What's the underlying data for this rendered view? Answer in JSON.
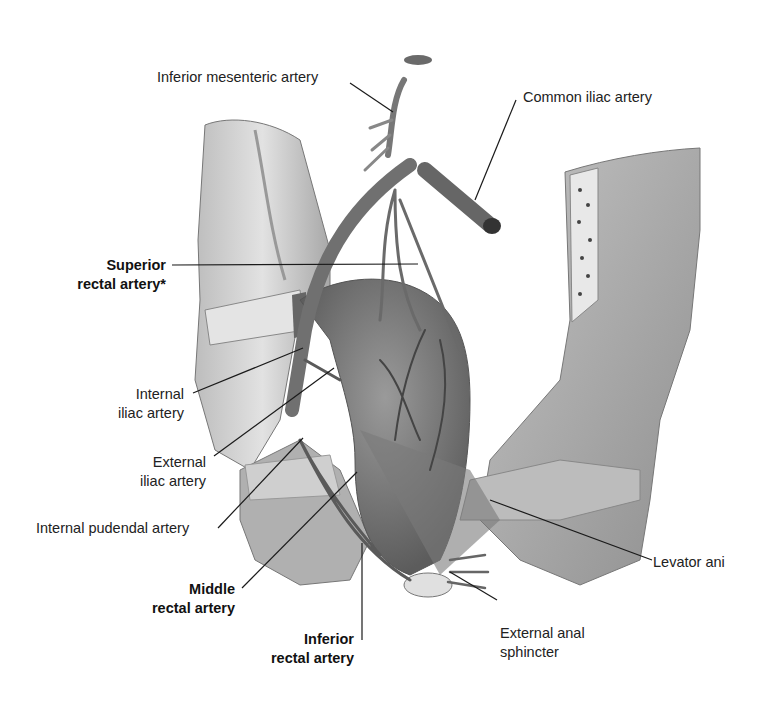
{
  "figure": {
    "colors": {
      "background": "#ffffff",
      "label_text": "#222222",
      "leader_line": "#1a1a1a",
      "artery": "#6e6e6e",
      "tissue": "#c8c8c8",
      "bone": "#b8b8b8"
    }
  },
  "labels": {
    "inferior_mesenteric": {
      "text": "Inferior mesenteric artery",
      "bold": false
    },
    "common_iliac": {
      "text": "Common iliac artery",
      "bold": false
    },
    "superior_rectal": {
      "line1": "Superior",
      "line2": "rectal artery*",
      "bold": true
    },
    "internal_iliac": {
      "line1": "Internal",
      "line2": "iliac artery",
      "bold": false
    },
    "external_iliac": {
      "line1": "External",
      "line2": "iliac artery",
      "bold": false
    },
    "internal_pudendal": {
      "text": "Internal pudendal artery",
      "bold": false
    },
    "middle_rectal": {
      "line1": "Middle",
      "line2": "rectal artery",
      "bold": true
    },
    "inferior_rectal": {
      "line1": "Inferior",
      "line2": "rectal artery",
      "bold": true
    },
    "levator_ani": {
      "text": "Levator ani",
      "bold": false
    },
    "external_anal_sphincter": {
      "line1": "External anal",
      "line2": "sphincter",
      "bold": false
    }
  }
}
